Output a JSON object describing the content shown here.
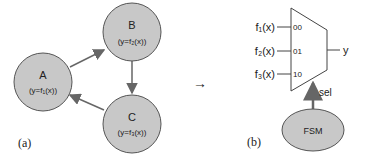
{
  "diagram_a": {
    "caption": "(a)",
    "states": [
      {
        "id": "A",
        "name": "A",
        "func": "(y=f₁(x))"
      },
      {
        "id": "B",
        "name": "B",
        "func": "(y=f₂(x))"
      },
      {
        "id": "C",
        "name": "C",
        "func": "(y=f₃(x))"
      }
    ],
    "transitions": [
      [
        "A",
        "B"
      ],
      [
        "B",
        "C"
      ],
      [
        "C",
        "A"
      ]
    ]
  },
  "arrow_label": "→",
  "diagram_b": {
    "caption": "(b)",
    "inputs": [
      {
        "label": "f₁(x)",
        "code": "00"
      },
      {
        "label": "f₂(x)",
        "code": "01"
      },
      {
        "label": "f₃(x)",
        "code": "10"
      }
    ],
    "output": "y",
    "select": "sel",
    "controller": "FSM"
  },
  "colors": {
    "node_fill": "#c8c8c8",
    "stroke": "#555555",
    "arrow": "#666666"
  }
}
